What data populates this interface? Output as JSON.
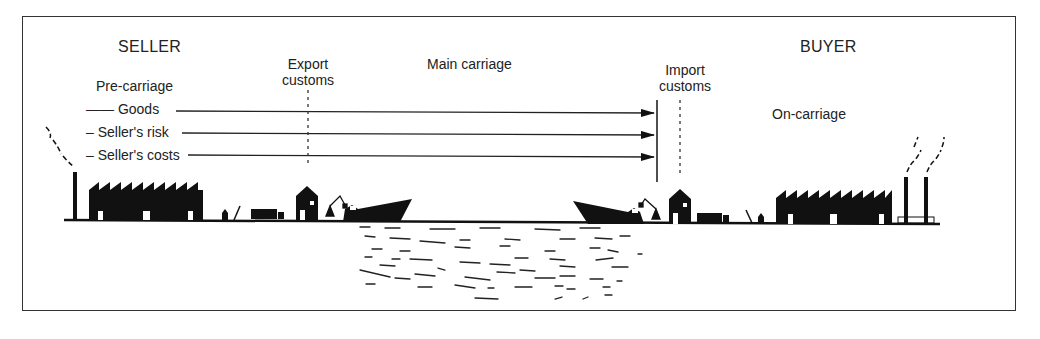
{
  "diagram": {
    "type": "incoterm-transport-chain",
    "parties": {
      "seller": "SELLER",
      "buyer": "BUYER"
    },
    "stages": {
      "pre_carriage": "Pre-carriage",
      "export_customs_line1": "Export",
      "export_customs_line2": "customs",
      "main_carriage": "Main carriage",
      "import_customs_line1": "Import",
      "import_customs_line2": "customs",
      "on_carriage": "On-carriage"
    },
    "arrows": [
      {
        "label": "Goods",
        "prefix": "——"
      },
      {
        "label": "Seller's risk",
        "prefix": "–"
      },
      {
        "label": "Seller's costs",
        "prefix": "–"
      }
    ],
    "transfer_point": "Import customs (buyer side of main carriage)",
    "colors": {
      "ink": "#111111",
      "frame": "#333333",
      "background": "#ffffff"
    }
  }
}
